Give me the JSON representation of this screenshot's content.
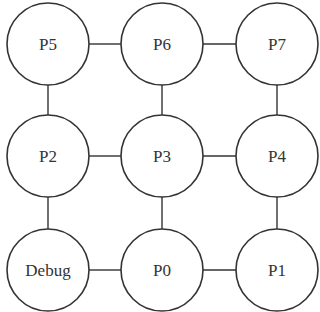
{
  "diagram": {
    "type": "2D mesh network",
    "nodes": [
      {
        "id": "P5",
        "label": "P5",
        "row": 0,
        "col": 0
      },
      {
        "id": "P6",
        "label": "P6",
        "row": 0,
        "col": 1
      },
      {
        "id": "P7",
        "label": "P7",
        "row": 0,
        "col": 2
      },
      {
        "id": "P2",
        "label": "P2",
        "row": 1,
        "col": 0
      },
      {
        "id": "P3",
        "label": "P3",
        "row": 1,
        "col": 1
      },
      {
        "id": "P4",
        "label": "P4",
        "row": 1,
        "col": 2
      },
      {
        "id": "Debug",
        "label": "Debug",
        "row": 2,
        "col": 0
      },
      {
        "id": "P0",
        "label": "P0",
        "row": 2,
        "col": 1
      },
      {
        "id": "P1",
        "label": "P1",
        "row": 2,
        "col": 2
      }
    ],
    "edges": [
      [
        "P5",
        "P6"
      ],
      [
        "P6",
        "P7"
      ],
      [
        "P2",
        "P3"
      ],
      [
        "P3",
        "P4"
      ],
      [
        "Debug",
        "P0"
      ],
      [
        "P0",
        "P1"
      ],
      [
        "P5",
        "P2"
      ],
      [
        "P2",
        "Debug"
      ],
      [
        "P6",
        "P3"
      ],
      [
        "P3",
        "P0"
      ],
      [
        "P7",
        "P4"
      ],
      [
        "P4",
        "P1"
      ]
    ],
    "colors": {
      "stroke": "#333333",
      "fill": "#ffffff",
      "text": "#333333"
    }
  }
}
